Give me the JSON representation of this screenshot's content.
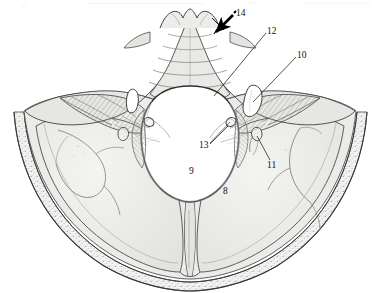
{
  "figure": {
    "type": "anatomical-line-drawing",
    "background_color": "#ffffff",
    "bone_fill_color": "#ebebe9",
    "bone_fill_shadow": "#dcdcd8",
    "outline_color": "#3a3a3a",
    "hatch_color": "#8d8d8d",
    "cavity_color": "#ffffff",
    "label_color": "#111111",
    "arrow_color": "#000000"
  },
  "labels": [
    {
      "id": "label-14",
      "text": "14",
      "x": 236,
      "y": 9,
      "leader": "arrow"
    },
    {
      "id": "label-12",
      "text": "12",
      "x": 267,
      "y": 27,
      "leader": "line"
    },
    {
      "id": "label-10",
      "text": "10",
      "x": 297,
      "y": 51,
      "leader": "line"
    },
    {
      "id": "label-13",
      "text": "13",
      "x": 199,
      "y": 141,
      "leader": "line"
    },
    {
      "id": "label-11",
      "text": "11",
      "x": 267,
      "y": 161,
      "leader": "line"
    },
    {
      "id": "label-9",
      "text": "9",
      "x": 189,
      "y": 167,
      "leader": "none"
    },
    {
      "id": "label-8",
      "text": "8",
      "x": 223,
      "y": 187,
      "leader": "none"
    }
  ],
  "leaders": [
    {
      "id": "leader-14",
      "from": [
        232,
        16
      ],
      "to": [
        214,
        33
      ],
      "type": "arrow"
    },
    {
      "id": "leader-12",
      "from": [
        266,
        33
      ],
      "to": [
        214,
        96
      ],
      "type": "line"
    },
    {
      "id": "leader-10",
      "from": [
        296,
        57
      ],
      "to": [
        253,
        102
      ],
      "type": "line"
    },
    {
      "id": "leader-13",
      "from": [
        210,
        144
      ],
      "to": [
        228,
        126
      ],
      "type": "line"
    },
    {
      "id": "leader-11",
      "from": [
        270,
        160
      ],
      "to": [
        257,
        136
      ],
      "type": "line"
    }
  ],
  "regions": [
    {
      "id": "foramen-magnum",
      "label_ref": "9",
      "name": "foramen magnum"
    },
    {
      "id": "occipital-condyle-area",
      "label_ref": "8",
      "name": "occipital bone"
    },
    {
      "id": "hypoglossal-canal",
      "label_ref": "13",
      "name": "hypoglossal canal"
    },
    {
      "id": "jugular-foramen",
      "label_ref": "10",
      "name": "jugular foramen"
    },
    {
      "id": "petrous-ridge",
      "label_ref": "12",
      "name": "petrous temporal ridge"
    },
    {
      "id": "clivus-crest",
      "label_ref": "14",
      "name": "dorsum sellae / clivus"
    },
    {
      "id": "condylar-canal",
      "label_ref": "11",
      "name": "condylar canal"
    }
  ]
}
